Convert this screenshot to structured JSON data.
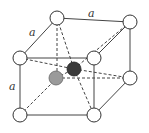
{
  "diagram": {
    "type": "crystal-unit-cell",
    "labels": {
      "top_edge": "a",
      "side_edge": "a",
      "vertical_edge": "a"
    },
    "corner_atom_color": "#ffffff",
    "interior_atoms": [
      {
        "name": "gray-atom",
        "color": "#9a9a9a"
      },
      {
        "name": "dark-atom",
        "color": "#3a3a3a"
      }
    ]
  }
}
